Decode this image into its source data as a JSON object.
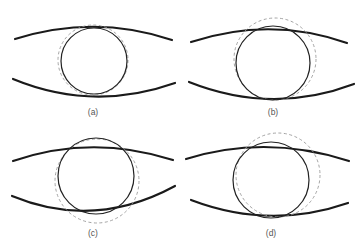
{
  "figure": {
    "panels": [
      {
        "id": "a",
        "label": "(a)",
        "dashed_offset": "concentric"
      },
      {
        "id": "b",
        "label": "(b)",
        "dashed_offset": "up"
      },
      {
        "id": "c",
        "label": "(c)",
        "dashed_offset": "down"
      },
      {
        "id": "d",
        "label": "(d)",
        "dashed_offset": "up-right"
      }
    ],
    "colors": {
      "curve": "#1a1a1a",
      "solid_circle": "#222222",
      "dashed_circle": "#9a9a9a",
      "label": "#555555"
    }
  }
}
